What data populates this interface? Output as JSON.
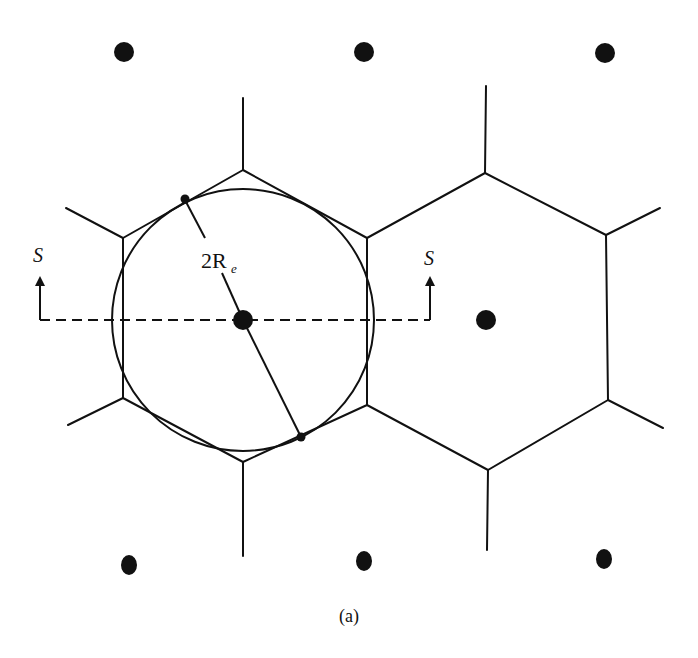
{
  "figure": {
    "caption": "(a)",
    "radius_label": "2R",
    "radius_label_subscript": "e",
    "section_label_left": "S",
    "section_label_right": "S",
    "colors": {
      "stroke": "#111111",
      "background": "#ffffff"
    }
  },
  "lattice_points": [
    {
      "x": 124,
      "y": 52
    },
    {
      "x": 364,
      "y": 52
    },
    {
      "x": 605,
      "y": 53
    },
    {
      "x": 243,
      "y": 320
    },
    {
      "x": 486,
      "y": 320
    },
    {
      "x": 126,
      "y": 565
    },
    {
      "x": 364,
      "y": 561
    },
    {
      "x": 604,
      "y": 559
    }
  ],
  "hexagons": [
    {
      "name": "left-cell",
      "center": [
        243,
        320
      ]
    },
    {
      "name": "right-cell",
      "center": [
        486,
        320
      ]
    }
  ],
  "equivalent_circle": {
    "cx": 243,
    "cy": 320,
    "r": 131
  }
}
